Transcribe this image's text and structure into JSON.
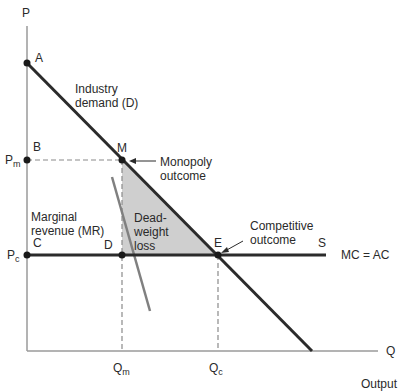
{
  "axes": {
    "y_label": "P",
    "x_label": "Q",
    "x_caption": "Output"
  },
  "points": {
    "A": "A",
    "B": "B",
    "C": "C",
    "D": "D",
    "E": "E",
    "M": "M",
    "S": "S"
  },
  "price_labels": {
    "pm_main": "P",
    "pm_sub": "m",
    "pc_main": "P",
    "pc_sub": "c"
  },
  "quantity_labels": {
    "qm_main": "Q",
    "qm_sub": "m",
    "qc_main": "Q",
    "qc_sub": "c"
  },
  "curves": {
    "demand_line1": "Industry",
    "demand_line2": "demand (D)",
    "mr_line1": "Marginal",
    "mr_line2": "revenue (MR)",
    "mc_label": "MC = AC"
  },
  "annotations": {
    "monopoly_line1": "Monopoly",
    "monopoly_line2": "outcome",
    "competitive_line1": "Competitive",
    "competitive_line2": "outcome",
    "dwl_line1": "Dead-",
    "dwl_line2": "weight",
    "dwl_line3": "loss"
  },
  "colors": {
    "demand": "#2b2b2b",
    "mr": "#808080",
    "mc": "#2b2b2b",
    "deadweight_fill": "#cfcfcf",
    "axis": "#9a9a9a"
  }
}
